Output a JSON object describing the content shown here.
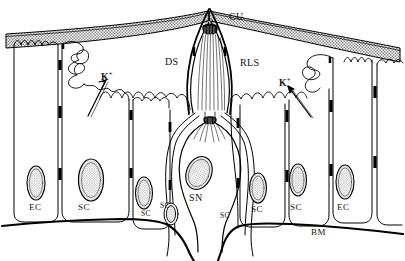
{
  "figure": {
    "type": "biological-schematic",
    "width": 405,
    "height": 261,
    "background_color": "#ffffff",
    "line_color": "#000000",
    "cuticle_fill": "#9a9a9a",
    "nucleus_fill": "#c9c9c9"
  },
  "labels": [
    {
      "id": "cuticle",
      "text": "CU",
      "size": "lg",
      "x": 229,
      "y": 12,
      "interactable": false
    },
    {
      "id": "dendritic-sheath",
      "text": "DS",
      "size": "lg",
      "x": 165,
      "y": 57,
      "interactable": false
    },
    {
      "id": "receptor-lymph-space",
      "text": "RLS",
      "size": "lg",
      "x": 240,
      "y": 58,
      "interactable": false
    },
    {
      "id": "potassium-left",
      "text": "K",
      "sup": "+",
      "size": "ion",
      "x": 101,
      "y": 71,
      "interactable": false
    },
    {
      "id": "potassium-right",
      "text": "K",
      "sup": "+",
      "size": "ion",
      "x": 279,
      "y": 77,
      "interactable": false
    },
    {
      "id": "sensory-neuron",
      "text": "SN",
      "size": "lg",
      "x": 189,
      "y": 193,
      "interactable": false
    },
    {
      "id": "epidermal-cell-left",
      "text": "EC",
      "size": "md",
      "x": 29,
      "y": 203,
      "interactable": false
    },
    {
      "id": "support-cell-1",
      "text": "SC",
      "size": "md",
      "x": 78,
      "y": 203,
      "interactable": false
    },
    {
      "id": "support-cell-2",
      "text": "SC",
      "size": "sm",
      "x": 141,
      "y": 210,
      "interactable": false
    },
    {
      "id": "support-cell-3",
      "text": "SC",
      "size": "sm",
      "x": 160,
      "y": 202,
      "interactable": false
    },
    {
      "id": "support-cell-4",
      "text": "SC",
      "size": "sm",
      "x": 220,
      "y": 212,
      "interactable": false
    },
    {
      "id": "support-cell-5",
      "text": "SC",
      "size": "md",
      "x": 251,
      "y": 205,
      "interactable": false
    },
    {
      "id": "support-cell-6",
      "text": "SC",
      "size": "md",
      "x": 290,
      "y": 203,
      "interactable": false
    },
    {
      "id": "epidermal-cell-right",
      "text": "EC",
      "size": "md",
      "x": 337,
      "y": 203,
      "interactable": false
    },
    {
      "id": "basement-membrane",
      "text": "BM",
      "size": "md",
      "x": 311,
      "y": 228,
      "interactable": false
    }
  ],
  "structures": {
    "cuticle": "CU",
    "dendritic_sheath": "DS",
    "receptor_lymph_space": "RLS",
    "sensory_neuron": "SN",
    "epidermal_cell": "EC",
    "support_cell": "SC",
    "basement_membrane": "BM",
    "ion": "K+"
  },
  "arrows": [
    {
      "id": "k-arrow-left",
      "from": [
        108,
        108
      ],
      "to": [
        88,
        78
      ],
      "meaning": "K+ transport into receptor lymph space"
    },
    {
      "id": "k-arrow-right",
      "from": [
        300,
        110
      ],
      "to": [
        277,
        86
      ],
      "meaning": "K+ transport into receptor lymph space"
    }
  ]
}
